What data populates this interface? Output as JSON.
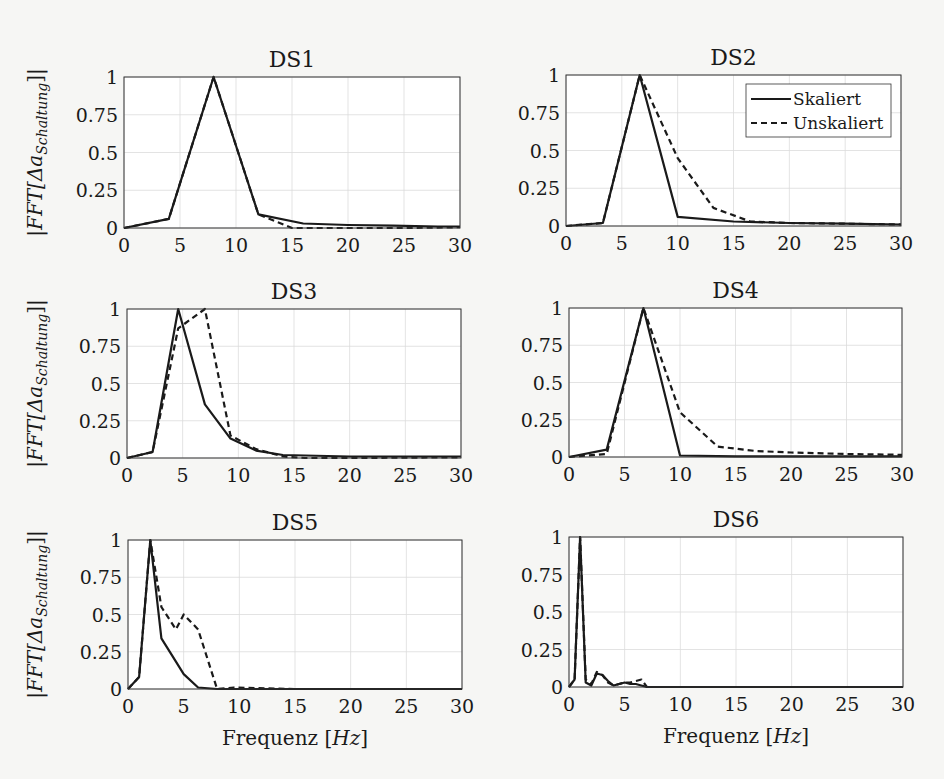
{
  "figure": {
    "ylabel": "|FFT[Δa_Schaltung]|",
    "ylabel_main": "|FFT[Δa",
    "ylabel_sub": "Schaltung",
    "ylabel_end": "]|",
    "xlabel": "Frequenz [Hz]",
    "xlabel_main": "Frequenz [",
    "xlabel_unit": "Hz",
    "xlabel_end": "]",
    "legend": [
      {
        "label": "Skaliert",
        "style": "solid"
      },
      {
        "label": "Unskaliert",
        "style": "dashed"
      }
    ],
    "xticks": [
      "0",
      "5",
      "10",
      "15",
      "20",
      "25",
      "30"
    ],
    "yticks": [
      "0",
      "0.25",
      "0.5",
      "0.75",
      "1"
    ]
  },
  "chart_data": [
    {
      "type": "line",
      "title": "DS1",
      "xlabel": "",
      "ylabel": "|FFT[Δa_Schaltung]|",
      "xlim": [
        0,
        30
      ],
      "ylim": [
        0,
        1
      ],
      "grid": true,
      "series": [
        {
          "name": "Skaliert",
          "x": [
            0,
            4,
            8,
            12,
            16,
            20,
            24,
            28,
            30
          ],
          "y": [
            0,
            0.06,
            1.0,
            0.09,
            0.03,
            0.02,
            0.015,
            0.01,
            0.01
          ]
        },
        {
          "name": "Unskaliert",
          "x": [
            0,
            4,
            8,
            12,
            15,
            20,
            25,
            30
          ],
          "y": [
            0,
            0.06,
            1.0,
            0.09,
            0.0,
            0.0,
            0.0,
            0.005
          ]
        }
      ]
    },
    {
      "type": "line",
      "title": "DS2",
      "xlabel": "",
      "ylabel": "",
      "xlim": [
        0,
        30
      ],
      "ylim": [
        0,
        1
      ],
      "grid": true,
      "legend_position": "upper right",
      "series": [
        {
          "name": "Skaliert",
          "x": [
            0,
            3.3,
            6.6,
            10,
            15,
            20,
            25,
            30
          ],
          "y": [
            0,
            0.02,
            1.0,
            0.06,
            0.03,
            0.02,
            0.015,
            0.01
          ]
        },
        {
          "name": "Unskaliert",
          "x": [
            0,
            3.3,
            6.6,
            10,
            13.2,
            16.5,
            20,
            25,
            30
          ],
          "y": [
            0,
            0.02,
            1.0,
            0.45,
            0.12,
            0.03,
            0.02,
            0.015,
            0.01
          ]
        }
      ]
    },
    {
      "type": "line",
      "title": "DS3",
      "xlabel": "",
      "ylabel": "|FFT[Δa_Schaltung]|",
      "xlim": [
        0,
        30
      ],
      "ylim": [
        0,
        1
      ],
      "grid": true,
      "series": [
        {
          "name": "Skaliert",
          "x": [
            0,
            2.3,
            4.6,
            7,
            9.3,
            11.6,
            14,
            20,
            30
          ],
          "y": [
            0,
            0.04,
            1.0,
            0.36,
            0.13,
            0.05,
            0.02,
            0.01,
            0.01
          ]
        },
        {
          "name": "Unskaliert",
          "x": [
            0,
            2.3,
            4.6,
            7,
            9.3,
            11.6,
            14,
            16,
            20,
            30
          ],
          "y": [
            0,
            0.04,
            0.87,
            1.0,
            0.15,
            0.06,
            0.01,
            0.0,
            0.0,
            0.005
          ]
        }
      ]
    },
    {
      "type": "line",
      "title": "DS4",
      "xlabel": "",
      "ylabel": "",
      "xlim": [
        0,
        30
      ],
      "ylim": [
        0,
        1
      ],
      "grid": true,
      "series": [
        {
          "name": "Skaliert",
          "x": [
            0,
            3.4,
            6.7,
            10,
            15,
            20,
            25,
            30
          ],
          "y": [
            0,
            0.05,
            1.0,
            0.01,
            0.005,
            0.005,
            0.005,
            0.005
          ]
        },
        {
          "name": "Unskaliert",
          "x": [
            0,
            3.4,
            6.7,
            10,
            13.4,
            16.8,
            20,
            25,
            30
          ],
          "y": [
            0,
            0.02,
            1.0,
            0.3,
            0.07,
            0.04,
            0.03,
            0.02,
            0.015
          ]
        }
      ]
    },
    {
      "type": "line",
      "title": "DS5",
      "xlabel": "Frequenz [Hz]",
      "ylabel": "|FFT[Δa_Schaltung]|",
      "xlim": [
        0,
        30
      ],
      "ylim": [
        0,
        1
      ],
      "grid": true,
      "series": [
        {
          "name": "Skaliert",
          "x": [
            0,
            1,
            2,
            3,
            4,
            5,
            6.3,
            8,
            15,
            30
          ],
          "y": [
            0,
            0.08,
            1.0,
            0.34,
            0.22,
            0.1,
            0.01,
            0.0,
            0.0,
            0.0
          ]
        },
        {
          "name": "Unskaliert",
          "x": [
            0,
            1,
            2,
            3,
            4.3,
            5,
            6.3,
            8,
            9.5,
            15,
            30
          ],
          "y": [
            0,
            0.08,
            1.0,
            0.55,
            0.4,
            0.5,
            0.4,
            0.0,
            0.01,
            0.0,
            0.0
          ]
        }
      ]
    },
    {
      "type": "line",
      "title": "DS6",
      "xlabel": "Frequenz [Hz]",
      "ylabel": "",
      "xlim": [
        0,
        30
      ],
      "ylim": [
        0,
        1
      ],
      "grid": true,
      "series": [
        {
          "name": "Skaliert",
          "x": [
            0,
            0.5,
            1.0,
            1.5,
            2.0,
            2.5,
            3.0,
            3.5,
            4.0,
            5.0,
            5.5,
            6.0,
            7.0,
            10,
            30
          ],
          "y": [
            0,
            0.05,
            1.0,
            0.03,
            0.01,
            0.09,
            0.08,
            0.04,
            0.01,
            0.03,
            0.02,
            0.02,
            0.0,
            0.0,
            0.0
          ]
        },
        {
          "name": "Unskaliert",
          "x": [
            0,
            0.5,
            1.0,
            1.5,
            2.0,
            2.5,
            3.0,
            3.5,
            4.0,
            5.0,
            5.5,
            6.5,
            7.0,
            10,
            30
          ],
          "y": [
            0,
            0.05,
            1.0,
            0.05,
            0.02,
            0.1,
            0.08,
            0.03,
            0.01,
            0.03,
            0.03,
            0.05,
            0.0,
            0.0,
            0.0
          ]
        }
      ]
    }
  ]
}
